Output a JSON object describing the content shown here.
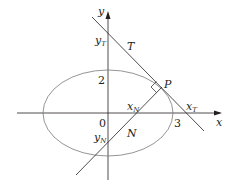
{
  "diagram": {
    "axes": {
      "x_label": "x",
      "y_label": "y",
      "origin_label": "0"
    },
    "ticks": {
      "y_tick": "2",
      "x_tick": "3"
    },
    "points": {
      "P": "P"
    },
    "lines": {
      "tangent": "T",
      "normal": "N"
    },
    "intercepts": {
      "y_T": {
        "base": "y",
        "sub": "T"
      },
      "x_T": {
        "base": "x",
        "sub": "T"
      },
      "x_N": {
        "base": "x",
        "sub": "N"
      },
      "y_N": {
        "base": "y",
        "sub": "N"
      }
    },
    "colors": {
      "axis": "#231f20",
      "ellipse": "#7a7a7a",
      "lines": "#231f20"
    }
  }
}
